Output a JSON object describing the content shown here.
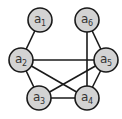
{
  "diagram": {
    "type": "undirected-graph",
    "colors": {
      "node_fill": "#d3d3d3",
      "stroke": "#1a1a1a",
      "label": "#333333",
      "background": "#ffffff"
    },
    "nodes": [
      {
        "id": "a1",
        "base": "a",
        "sub": "1",
        "x": 40,
        "y": 20
      },
      {
        "id": "a6",
        "base": "a",
        "sub": "6",
        "x": 87,
        "y": 20
      },
      {
        "id": "a2",
        "base": "a",
        "sub": "2",
        "x": 21,
        "y": 60
      },
      {
        "id": "a5",
        "base": "a",
        "sub": "5",
        "x": 106,
        "y": 60
      },
      {
        "id": "a3",
        "base": "a",
        "sub": "3",
        "x": 39,
        "y": 98
      },
      {
        "id": "a4",
        "base": "a",
        "sub": "4",
        "x": 87,
        "y": 98
      }
    ],
    "edges": [
      [
        "a1",
        "a2"
      ],
      [
        "a2",
        "a5"
      ],
      [
        "a2",
        "a3"
      ],
      [
        "a2",
        "a4"
      ],
      [
        "a3",
        "a4"
      ],
      [
        "a3",
        "a5"
      ],
      [
        "a4",
        "a5"
      ],
      [
        "a6",
        "a5"
      ],
      [
        "a6",
        "a4"
      ]
    ]
  }
}
